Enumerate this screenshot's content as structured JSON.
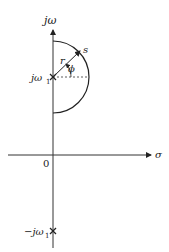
{
  "diagram": {
    "vertical_axis_label": "jω",
    "horizontal_axis_label": "σ",
    "origin_label": "0",
    "upper_pole_label": "jω",
    "upper_pole_sub": "1",
    "lower_pole_label": "−jω",
    "lower_pole_sub": "1",
    "radius_label": "r",
    "angle_label": "ϕ",
    "point_label": "s"
  }
}
